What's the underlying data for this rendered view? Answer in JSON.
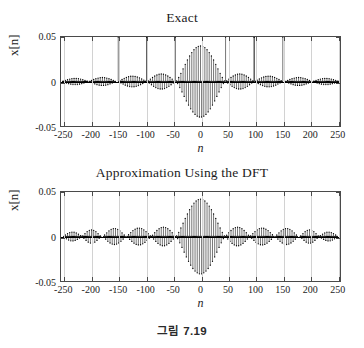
{
  "figure": {
    "caption": "그림 7.19",
    "background_color": "#ffffff",
    "axis_color": "#4a4a4a",
    "grid_color": "#d2d2d2",
    "stem_color": "#000000"
  },
  "panels": [
    {
      "title": "Exact",
      "ylabel": "x[n]",
      "xlabel": "n"
    },
    {
      "title": "Approximation Using the DFT",
      "ylabel": "x[n]",
      "xlabel": "n"
    }
  ],
  "chart_data": [
    {
      "type": "line",
      "title": "Exact",
      "xlabel": "n",
      "ylabel": "x[n]",
      "xlim": [
        -256,
        256
      ],
      "ylim": [
        -0.05,
        0.05
      ],
      "xticks": [
        -250,
        -200,
        -150,
        -100,
        -50,
        0,
        50,
        100,
        150,
        200,
        250
      ],
      "yticks": [
        0.05,
        0,
        -0.05
      ],
      "xtick_labels": [
        "-250",
        "-200",
        "-150",
        "-100",
        "-50",
        "0",
        "50",
        "100",
        "150",
        "200",
        "250"
      ],
      "ytick_labels": [
        "0.05",
        "0",
        "-0.05"
      ],
      "grid": true,
      "legend": null,
      "plot_style": "stem",
      "description": "Modulated sinc-like discrete sequence: rapidly oscillating carrier inside a slowly varying envelope with a large main lobe centered at n=0 reaching +/-0.040 and a series of smaller decaying side lobes.",
      "envelope": {
        "main_lobe_peak": 0.04,
        "main_lobe_half_width": 45,
        "carrier_period_samples": 4,
        "side_lobe_centers": [
          -230,
          -180,
          -125,
          -72,
          72,
          125,
          180,
          230
        ],
        "side_lobe_peaks": [
          0.0035,
          0.0045,
          0.006,
          0.0085,
          0.0085,
          0.006,
          0.0045,
          0.0035
        ]
      }
    },
    {
      "type": "line",
      "title": "Approximation Using the DFT",
      "xlabel": "n",
      "ylabel": "x[n]",
      "xlim": [
        -256,
        256
      ],
      "ylim": [
        -0.05,
        0.05
      ],
      "xticks": [
        -250,
        -200,
        -150,
        -100,
        -50,
        0,
        50,
        100,
        150,
        200,
        250
      ],
      "yticks": [
        0.05,
        0,
        -0.05
      ],
      "xtick_labels": [
        "-250",
        "-200",
        "-150",
        "-100",
        "-50",
        "0",
        "50",
        "100",
        "150",
        "200",
        "250"
      ],
      "ytick_labels": [
        "0.05",
        "0",
        "-0.05"
      ],
      "grid": true,
      "legend": null,
      "plot_style": "stem",
      "description": "DFT-based approximation of the same sequence: nearly identical main lobe at n=0 with peak +/-0.042, but noticeably larger and more uniform side lobes across the full record, showing time-domain aliasing/leakage.",
      "envelope": {
        "main_lobe_peak": 0.042,
        "main_lobe_half_width": 45,
        "carrier_period_samples": 4,
        "side_lobe_centers": [
          -235,
          -200,
          -158,
          -113,
          -68,
          68,
          113,
          158,
          200,
          235
        ],
        "side_lobe_peaks": [
          0.005,
          0.0075,
          0.009,
          0.0095,
          0.0105,
          0.0105,
          0.0095,
          0.009,
          0.0075,
          0.005
        ]
      }
    }
  ]
}
